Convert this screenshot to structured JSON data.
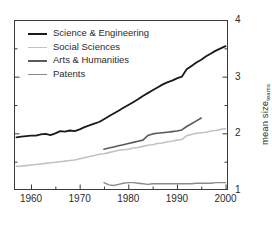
{
  "chart_data": {
    "type": "line",
    "title": "",
    "xlabel": "",
    "ylabel": "mean size",
    "ylabel_sub": "teams",
    "xlim": [
      1956.5,
      2000.5
    ],
    "ylim": [
      1,
      4
    ],
    "grid": false,
    "legend_position": "top-left",
    "x_ticks": [
      1960,
      1970,
      1980,
      1990,
      2000
    ],
    "x_minor_ticks": [
      1965,
      1975,
      1985,
      1995
    ],
    "y_ticks": [
      1,
      2,
      3,
      4
    ],
    "y_minor_ticks": [
      1.5,
      2.5,
      3.5
    ],
    "x_tick_labels": [
      "1960",
      "1970",
      "1980",
      "1990",
      "2000"
    ],
    "y_tick_labels": [
      "1",
      "2",
      "3",
      "4"
    ],
    "axis_label_side": "right",
    "series": [
      {
        "name": "Science & Engineering",
        "color": "#1a1a1a",
        "width": 1.8,
        "x": [
          1957,
          1958,
          1959,
          1960,
          1961,
          1962,
          1963,
          1964,
          1965,
          1966,
          1967,
          1968,
          1969,
          1970,
          1971,
          1972,
          1973,
          1974,
          1975,
          1976,
          1977,
          1978,
          1979,
          1980,
          1981,
          1982,
          1983,
          1984,
          1985,
          1986,
          1987,
          1988,
          1989,
          1990,
          1991,
          1992,
          1993,
          1994,
          1995,
          1996,
          1997,
          1998,
          1999,
          2000
        ],
        "y": [
          1.93,
          1.94,
          1.95,
          1.96,
          1.96,
          1.98,
          1.99,
          1.97,
          2.0,
          2.04,
          2.03,
          2.05,
          2.04,
          2.07,
          2.11,
          2.14,
          2.17,
          2.2,
          2.25,
          2.3,
          2.35,
          2.4,
          2.45,
          2.5,
          2.55,
          2.6,
          2.66,
          2.71,
          2.76,
          2.81,
          2.86,
          2.9,
          2.93,
          2.97,
          3.0,
          3.13,
          3.19,
          3.25,
          3.3,
          3.36,
          3.41,
          3.46,
          3.5,
          3.54
        ]
      },
      {
        "name": "Social Sciences",
        "color": "#c2c2c2",
        "width": 1.6,
        "x": [
          1957,
          1958,
          1959,
          1960,
          1961,
          1962,
          1963,
          1964,
          1965,
          1966,
          1967,
          1968,
          1969,
          1970,
          1971,
          1972,
          1973,
          1974,
          1975,
          1976,
          1977,
          1978,
          1979,
          1980,
          1981,
          1982,
          1983,
          1984,
          1985,
          1986,
          1987,
          1988,
          1989,
          1990,
          1991,
          1992,
          1993,
          1994,
          1995,
          1996,
          1997,
          1998,
          1999,
          2000
        ],
        "y": [
          1.42,
          1.42,
          1.43,
          1.44,
          1.45,
          1.46,
          1.47,
          1.48,
          1.49,
          1.5,
          1.51,
          1.52,
          1.53,
          1.55,
          1.57,
          1.59,
          1.61,
          1.63,
          1.64,
          1.66,
          1.68,
          1.7,
          1.71,
          1.72,
          1.74,
          1.75,
          1.77,
          1.79,
          1.8,
          1.82,
          1.83,
          1.85,
          1.86,
          1.88,
          1.89,
          1.96,
          1.98,
          2.0,
          2.01,
          2.02,
          2.04,
          2.05,
          2.07,
          2.08
        ]
      },
      {
        "name": "Arts & Humanities",
        "color": "#5a5a5a",
        "width": 1.6,
        "x": [
          1975,
          1976,
          1977,
          1978,
          1979,
          1980,
          1981,
          1982,
          1983,
          1984,
          1985,
          1986,
          1987,
          1988,
          1989,
          1990,
          1991,
          1992,
          1993,
          1994,
          1995
        ],
        "y": [
          1.72,
          1.74,
          1.76,
          1.78,
          1.8,
          1.82,
          1.84,
          1.86,
          1.88,
          1.96,
          1.99,
          2.0,
          2.01,
          2.02,
          2.03,
          2.04,
          2.06,
          2.12,
          2.17,
          2.22,
          2.27
        ]
      },
      {
        "name": "Patents",
        "color": "#8a8a8a",
        "width": 1.4,
        "x": [
          1975,
          1976,
          1977,
          1978,
          1979,
          1980,
          1981,
          1982,
          1983,
          1984,
          1985,
          1986,
          1987,
          1988,
          1989,
          1990,
          1991,
          1992,
          1993,
          1994,
          1995,
          1996,
          1997,
          1998,
          1999,
          2000
        ],
        "y": [
          1.13,
          1.09,
          1.08,
          1.1,
          1.12,
          1.13,
          1.13,
          1.12,
          1.11,
          1.1,
          1.11,
          1.11,
          1.11,
          1.11,
          1.11,
          1.11,
          1.11,
          1.11,
          1.11,
          1.12,
          1.12,
          1.12,
          1.12,
          1.13,
          1.13,
          1.13
        ]
      }
    ]
  },
  "legend": {
    "items": [
      {
        "label": "Science & Engineering"
      },
      {
        "label": "Social Sciences"
      },
      {
        "label": "Arts & Humanities"
      },
      {
        "label": "Patents"
      }
    ]
  }
}
